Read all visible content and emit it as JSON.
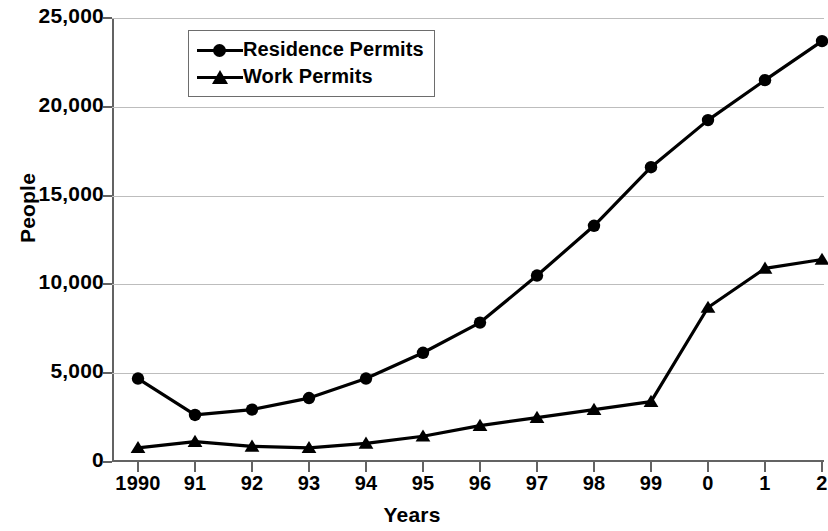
{
  "chart_data": {
    "type": "line",
    "title": "",
    "xlabel": "Years",
    "ylabel": "People",
    "categories": [
      "1990",
      "91",
      "92",
      "93",
      "94",
      "95",
      "96",
      "97",
      "98",
      "99",
      "0",
      "1",
      "2"
    ],
    "ylim": [
      0,
      25000
    ],
    "yticks": [
      0,
      5000,
      10000,
      15000,
      20000,
      25000
    ],
    "ytick_labels": [
      "0",
      "5,000",
      "10,000",
      "15,000",
      "20,000",
      "25,000"
    ],
    "grid": true,
    "legend_position": "top-left-inside",
    "series": [
      {
        "name": "Residence Permits",
        "marker": "circle",
        "color": "#000000",
        "values": [
          4700,
          2650,
          2950,
          3600,
          4700,
          6150,
          7850,
          10500,
          13300,
          16600,
          19250,
          21500,
          23700
        ]
      },
      {
        "name": "Work Permits",
        "marker": "triangle",
        "color": "#000000",
        "values": [
          800,
          1150,
          880,
          800,
          1050,
          1450,
          2050,
          2500,
          2950,
          3400,
          8700,
          10900,
          11400
        ]
      }
    ]
  },
  "legend": {
    "items": [
      {
        "label": "Residence Permits",
        "marker": "circle-marker-icon"
      },
      {
        "label": "Work Permits",
        "marker": "triangle-marker-icon"
      }
    ]
  },
  "axes": {
    "y_title": "People",
    "x_title": "Years"
  }
}
